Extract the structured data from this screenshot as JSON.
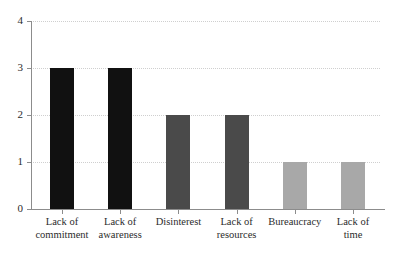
{
  "chart_data": {
    "type": "bar",
    "title": "",
    "subtitle": "",
    "xlabel": "",
    "ylabel": "",
    "categories": [
      "Lack of commitment",
      "Lack of awareness",
      "Disinterest",
      "Lack of resources",
      "Bureaucracy",
      "Lack of time"
    ],
    "category_lines": [
      [
        "Lack of",
        "commitment"
      ],
      [
        "Lack of",
        "awareness"
      ],
      [
        "Disinterest",
        ""
      ],
      [
        "Lack of",
        "resources"
      ],
      [
        "Bureaucracy",
        ""
      ],
      [
        "Lack of",
        "time"
      ]
    ],
    "values": [
      3,
      3,
      2,
      2,
      1,
      1
    ],
    "bar_colors": [
      "#111111",
      "#111111",
      "#4a4a4a",
      "#4a4a4a",
      "#a8a8a8",
      "#a8a8a8"
    ],
    "ylim": [
      0,
      4
    ],
    "yticks": [
      0,
      1,
      2,
      3,
      4
    ],
    "ytick_labels": [
      "0",
      "1",
      "2",
      "3",
      "4"
    ],
    "grid": true,
    "grid_style": "dotted",
    "grid_color": "#cfcfcf",
    "legend": false,
    "legend_position": "none",
    "axis_color": "#8c8c8c",
    "background": "#ffffff",
    "text_color": "#2b2b2b"
  }
}
